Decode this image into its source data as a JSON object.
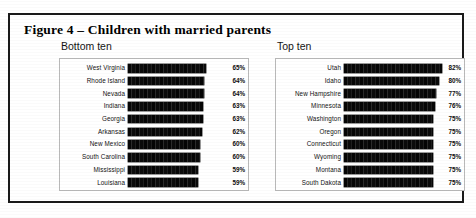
{
  "figure": {
    "title": "Figure 4 – Children with married parents"
  },
  "panels": {
    "bottom": {
      "title": "Bottom ten"
    },
    "top": {
      "title": "Top ten"
    }
  },
  "chart_data": [
    {
      "type": "bar",
      "title": "Bottom ten",
      "orientation": "horizontal",
      "xlabel": "",
      "ylabel": "",
      "xlim": [
        0,
        85
      ],
      "grid": false,
      "legend": "none",
      "value_suffix": "%",
      "categories": [
        "West Virginia",
        "Rhode Island",
        "Nevada",
        "Indiana",
        "Georgia",
        "Arkansas",
        "New Mexico",
        "South Carolina",
        "Mississippi",
        "Louisiana"
      ],
      "values": [
        65,
        64,
        64,
        63,
        63,
        62,
        60,
        60,
        59,
        59
      ],
      "labels": [
        "65%",
        "64%",
        "64%",
        "63%",
        "63%",
        "62%",
        "60%",
        "60%",
        "59%",
        "59%"
      ]
    },
    {
      "type": "bar",
      "title": "Top ten",
      "orientation": "horizontal",
      "xlabel": "",
      "ylabel": "",
      "xlim": [
        0,
        85
      ],
      "grid": false,
      "legend": "none",
      "value_suffix": "%",
      "categories": [
        "Utah",
        "Idaho",
        "New Hampshire",
        "Minnesota",
        "Washington",
        "Oregon",
        "Connecticut",
        "Wyoming",
        "Montana",
        "South Dakota"
      ],
      "values": [
        82,
        80,
        77,
        76,
        75,
        75,
        75,
        75,
        75,
        75
      ],
      "labels": [
        "82%",
        "80%",
        "77%",
        "76%",
        "75%",
        "75%",
        "75%",
        "75%",
        "75%",
        "75%"
      ]
    }
  ]
}
